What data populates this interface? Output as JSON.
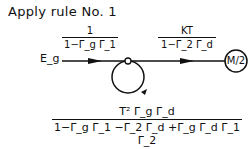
{
  "title": "Apply rule No. 1",
  "source_label": "E_g",
  "branches": [
    {
      "numerator": "1",
      "denominator": "1−Γ_g Γ_1"
    },
    {
      "numerator": "KT",
      "denominator": "1−Γ_2 Γ_d"
    }
  ],
  "sink_label": "M/2",
  "result": {
    "numerator": "T² Γ_g Γ_d",
    "denominator": "1−Γ_g Γ_1 −Γ_2 Γ_d +Γ_g Γ_d Γ_1 Γ_2"
  }
}
